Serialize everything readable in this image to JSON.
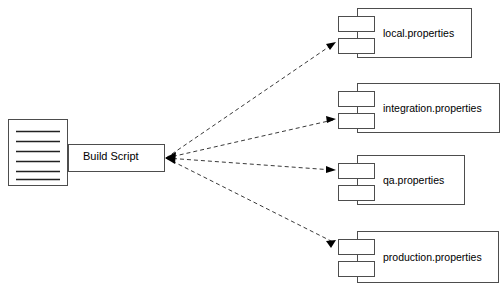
{
  "diagram": {
    "type": "uml-component-dependency",
    "background_color": "#ffffff",
    "stroke_color": "#4d4d4d",
    "text_color": "#000000",
    "source": {
      "document_icon_name": "document-icon",
      "document_line_count": 6,
      "box_label": "Build Script"
    },
    "components": [
      {
        "label": "local.properties",
        "icon_name": "uml-component-icon",
        "body": {
          "x": 357,
          "y": 8,
          "w": 115,
          "h": 50
        },
        "tabs": [
          {
            "x": 338,
            "y": 16,
            "w": 37,
            "h": 16
          },
          {
            "x": 338,
            "y": 38,
            "w": 37,
            "h": 16
          }
        ],
        "label_pos": {
          "x": 383,
          "y": 27
        },
        "arrow_target": {
          "x": 336,
          "y": 42
        }
      },
      {
        "label": "integration.properties",
        "icon_name": "uml-component-icon",
        "body": {
          "x": 357,
          "y": 83,
          "w": 143,
          "h": 50
        },
        "tabs": [
          {
            "x": 338,
            "y": 91,
            "w": 37,
            "h": 16
          },
          {
            "x": 338,
            "y": 113,
            "w": 37,
            "h": 16
          }
        ],
        "label_pos": {
          "x": 383,
          "y": 102
        },
        "arrow_target": {
          "x": 336,
          "y": 119
        }
      },
      {
        "label": "qa.properties",
        "icon_name": "uml-component-icon",
        "body": {
          "x": 357,
          "y": 155,
          "w": 108,
          "h": 50
        },
        "tabs": [
          {
            "x": 338,
            "y": 163,
            "w": 37,
            "h": 16
          },
          {
            "x": 338,
            "y": 185,
            "w": 37,
            "h": 16
          }
        ],
        "label_pos": {
          "x": 383,
          "y": 175
        },
        "arrow_target": {
          "x": 336,
          "y": 169
        }
      },
      {
        "label": "production.properties",
        "icon_name": "uml-component-icon",
        "body": {
          "x": 357,
          "y": 231,
          "w": 142,
          "h": 52
        },
        "tabs": [
          {
            "x": 338,
            "y": 239,
            "w": 37,
            "h": 16
          },
          {
            "x": 338,
            "y": 261,
            "w": 37,
            "h": 16
          }
        ],
        "label_pos": {
          "x": 383,
          "y": 251
        },
        "arrow_target": {
          "x": 336,
          "y": 241
        }
      }
    ],
    "connections": {
      "origin": {
        "x": 165,
        "y": 158
      },
      "style": "dashed",
      "arrowheads": "both-ends"
    }
  }
}
